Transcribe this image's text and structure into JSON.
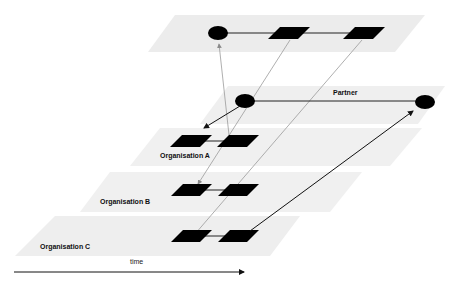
{
  "diagram": {
    "type": "layered-network-over-time",
    "layers": [
      {
        "id": "top",
        "label": ""
      },
      {
        "id": "partner",
        "label": "Partner"
      },
      {
        "id": "org-a",
        "label": "Organisation A"
      },
      {
        "id": "org-b",
        "label": "Organisation B"
      },
      {
        "id": "org-c",
        "label": "Organisation C"
      }
    ],
    "axis": {
      "label": "time"
    },
    "colors": {
      "plane": "#ebebeb",
      "node": "#000000",
      "gray_line": "#9a9a9a",
      "black_line": "#222222"
    }
  }
}
